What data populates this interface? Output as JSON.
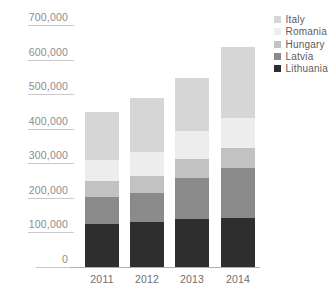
{
  "chart_data": {
    "type": "bar",
    "stacked": true,
    "title": "",
    "xlabel": "",
    "ylabel": "",
    "categories": [
      "2011",
      "2012",
      "2013",
      "2014"
    ],
    "ylim": [
      0,
      700000
    ],
    "ytick_values": [
      0,
      100000,
      200000,
      300000,
      400000,
      500000,
      600000,
      700000
    ],
    "ytick_labels": [
      "0",
      "100,000",
      "200,000",
      "300,000",
      "400,000",
      "500,000",
      "600,000",
      "700,000"
    ],
    "grid": true,
    "legend_position": "top-right",
    "series": [
      {
        "name": "Lithuania",
        "color": "#2e2e2e",
        "values": [
          124000,
          129000,
          140000,
          143000
        ]
      },
      {
        "name": "Latvia",
        "color": "#8a8a8a",
        "values": [
          78000,
          85000,
          117000,
          142000
        ]
      },
      {
        "name": "Hungary",
        "color": "#c2c2c2",
        "values": [
          47000,
          49000,
          55000,
          58000
        ]
      },
      {
        "name": "Romania",
        "color": "#ededed",
        "values": [
          61000,
          69000,
          80000,
          88000
        ]
      },
      {
        "name": "Italy",
        "color": "#d6d6d6",
        "values": [
          138000,
          156000,
          154000,
          204000
        ]
      }
    ],
    "totals": [
      448000,
      488000,
      546000,
      635000
    ],
    "colors": {
      "grid": "#c9c9c9",
      "axis": "#b0b0b0",
      "ytick_text": "#8c8c8c",
      "xtick_text": "#6e6e6e",
      "legend_text": "#5c5c5c",
      "background": "#ffffff"
    }
  }
}
